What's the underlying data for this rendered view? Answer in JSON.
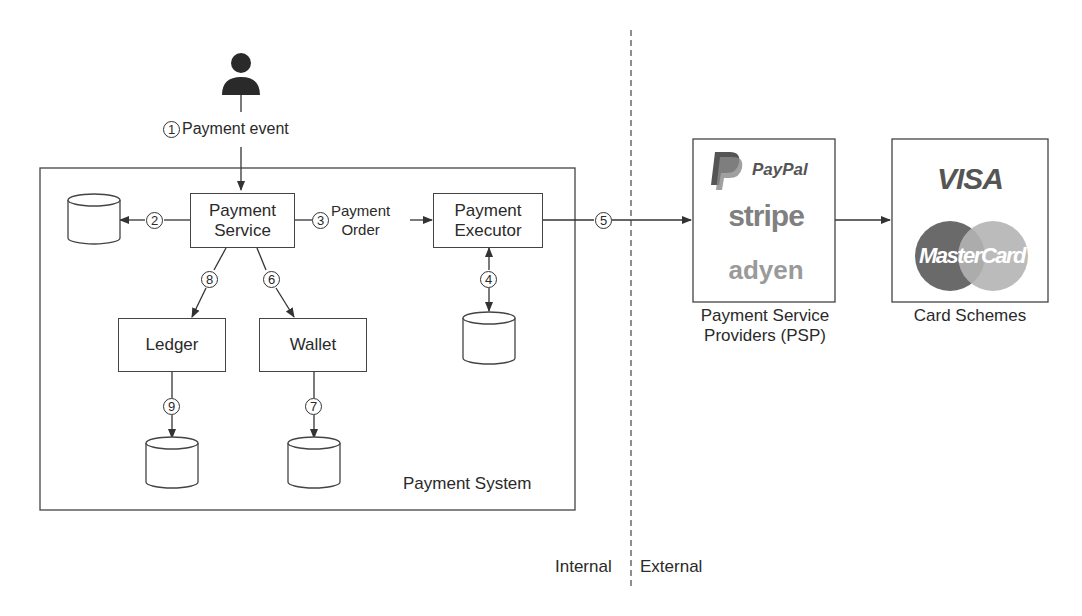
{
  "diagram": {
    "actor": {
      "icon": "user-icon"
    },
    "steps": {
      "s1": {
        "number": "1",
        "label": "Payment event"
      },
      "s2": {
        "number": "2"
      },
      "s3": {
        "number": "3",
        "label_line1": "Payment",
        "label_line2": "Order"
      },
      "s4": {
        "number": "4"
      },
      "s5": {
        "number": "5"
      },
      "s6": {
        "number": "6"
      },
      "s7": {
        "number": "7"
      },
      "s8": {
        "number": "8"
      },
      "s9": {
        "number": "9"
      }
    },
    "components": {
      "payment_service": {
        "line1": "Payment",
        "line2": "Service"
      },
      "payment_executor": {
        "line1": "Payment",
        "line2": "Executor"
      },
      "ledger": {
        "label": "Ledger"
      },
      "wallet": {
        "label": "Wallet"
      }
    },
    "system_boundary": {
      "label": "Payment System"
    },
    "psp": {
      "logos": [
        "PayPal",
        "stripe",
        "adyen"
      ],
      "caption_line1": "Payment Service",
      "caption_line2": "Providers (PSP)"
    },
    "card_schemes": {
      "logos": [
        "VISA",
        "MasterCard"
      ],
      "caption": "Card Schemes"
    },
    "divider": {
      "left_label": "Internal",
      "right_label": "External"
    },
    "colors": {
      "line": "#333333",
      "mc_red": "#6a6a6a",
      "mc_yellow": "#b4b4b4",
      "paypal": "#555555",
      "stripe": "#808080",
      "adyen": "#9a9a9a"
    }
  }
}
